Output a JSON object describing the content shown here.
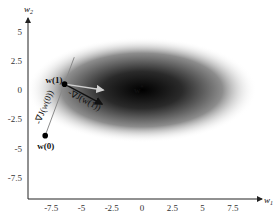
{
  "chart_data": {
    "type": "contour",
    "title": "",
    "xlabel": "w1",
    "ylabel": "w2",
    "xlim": [
      -10,
      10
    ],
    "ylim": [
      -10,
      6.5
    ],
    "x_ticks": [
      "-7.5",
      "-5",
      "-2.5",
      "0",
      "2.5",
      "5",
      "7.5"
    ],
    "y_ticks": [
      "5",
      "2.5",
      "0",
      "-2.5",
      "-5",
      "-7.5"
    ],
    "x_tick_values": [
      -7.5,
      -5,
      -2.5,
      0,
      2.5,
      5,
      7.5
    ],
    "y_tick_values": [
      5,
      2.5,
      0,
      -2.5,
      -5,
      -7.5
    ],
    "minimum": {
      "label": "w*",
      "x": 0,
      "y": 0
    },
    "ellipse_semi_axes": {
      "w1": 9.5,
      "w2": 4.5
    },
    "points": [
      {
        "label": "w(0)",
        "x": -8.0,
        "y": -3.9
      },
      {
        "label": "w(1)",
        "x": -6.4,
        "y": 0.5
      }
    ],
    "annotations": {
      "grad_w0": "-∇J(w(0))",
      "grad_w1": "-∇J(w(1))"
    },
    "vectors": [
      {
        "name": "gradient-line",
        "from": [
          -8.0,
          -3.9
        ],
        "to": [
          -5.6,
          2.8
        ],
        "color": "#8a8a8a"
      },
      {
        "name": "neg-gradient-w1",
        "from": [
          -6.4,
          0.5
        ],
        "to": [
          -3.3,
          -1.2
        ],
        "color": "#111111"
      },
      {
        "name": "direction-to-minimum",
        "from": [
          -6.4,
          0.5
        ],
        "to": [
          -3.2,
          0.0
        ],
        "color": "#cfcfcf"
      }
    ]
  }
}
